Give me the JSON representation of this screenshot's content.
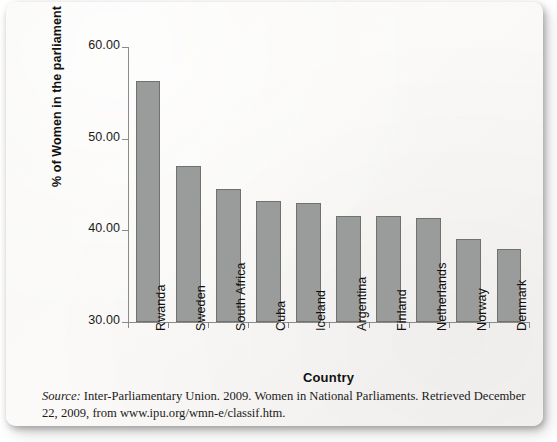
{
  "figure": {
    "source_label": "Source:",
    "source_text": " Inter-Parliamentary Union. 2009. Women in National Parliaments. Retrieved December 22, 2009, from www.ipu.org/wmn-e/classif.htm."
  },
  "chart_data": {
    "type": "bar",
    "title": "",
    "xlabel": "Country",
    "ylabel": "% of Women in the parliament",
    "categories": [
      "Rwanda",
      "Sweden",
      "South Africa",
      "Cuba",
      "Iceland",
      "Argentina",
      "Finland",
      "Netherlands",
      "Norway",
      "Denmark"
    ],
    "values": [
      56.3,
      47.0,
      44.5,
      43.2,
      43.0,
      41.6,
      41.6,
      41.3,
      39.1,
      38.0
    ],
    "ylim": [
      30.0,
      60.0
    ],
    "ytick_labels": [
      "60.00",
      "50.00",
      "40.00",
      "30.00"
    ],
    "ytick_values": [
      60.0,
      50.0,
      40.0,
      30.0
    ],
    "grid": false,
    "legend": "none",
    "bar_color": "#9a9b9b",
    "bar_edge_color": "#6f7070",
    "axis_color": "#8b8b8b"
  }
}
